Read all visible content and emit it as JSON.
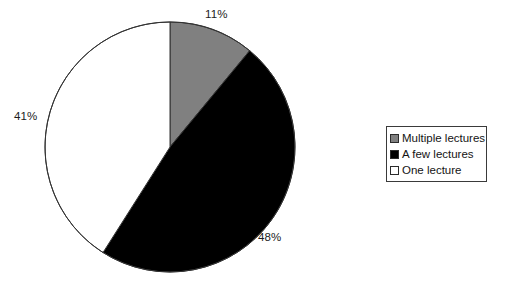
{
  "chart_data": {
    "type": "pie",
    "title": "",
    "subtitle": "",
    "xlabel": "",
    "ylabel": "",
    "grid": false,
    "legend_position": "right",
    "start_angle_deg": 0,
    "direction": "clockwise",
    "categories": [
      "Multiple lectures",
      "A few lectures",
      "One lecture"
    ],
    "values": [
      11,
      48,
      41
    ],
    "value_unit": "%",
    "data_labels": [
      "11%",
      "48%",
      "41%"
    ],
    "colors": [
      "#808080",
      "#000000",
      "#ffffff"
    ],
    "slices": [
      {
        "label": "Multiple lectures",
        "value": 11,
        "data_label": "11%",
        "color": "#808080",
        "start_deg": 0,
        "end_deg": 39.6
      },
      {
        "label": "A few lectures",
        "value": 48,
        "data_label": "48%",
        "color": "#000000",
        "start_deg": 39.6,
        "end_deg": 212.4
      },
      {
        "label": "One lecture",
        "value": 41,
        "data_label": "41%",
        "color": "#ffffff",
        "start_deg": 212.4,
        "end_deg": 360
      }
    ]
  },
  "labels": {
    "multiple_pct": "11%",
    "few_pct": "48%",
    "one_pct": "41%"
  },
  "legend": {
    "items": [
      {
        "label": "Multiple lectures",
        "color": "#808080",
        "swatch": "gray"
      },
      {
        "label": "A few lectures",
        "color": "#000000",
        "swatch": "black"
      },
      {
        "label": "One lecture",
        "color": "#ffffff",
        "swatch": "white"
      }
    ]
  },
  "geometry": {
    "center_x": 170,
    "center_y": 147,
    "radius": 125,
    "outline_color": "#333333"
  }
}
